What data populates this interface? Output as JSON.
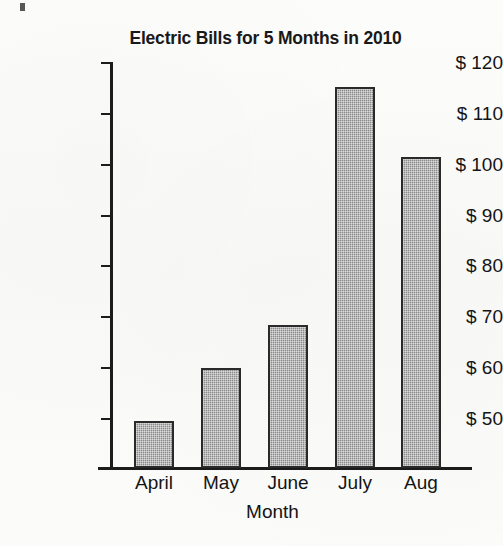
{
  "chart_data": {
    "type": "bar",
    "title": "Electric Bills for 5 Months in 2010",
    "xlabel": "Month",
    "ylabel": "",
    "categories": [
      "April",
      "May",
      "June",
      "July",
      "Aug"
    ],
    "values": [
      49.7,
      60.0,
      68.5,
      115.3,
      101.5
    ],
    "ylim": [
      45,
      120
    ],
    "y_ticks": [
      50,
      60,
      70,
      80,
      90,
      100,
      110,
      120
    ],
    "y_tick_labels": [
      "$ 50",
      "$ 60",
      "$ 70",
      "$ 80",
      "$ 90",
      "$ 100",
      "$ 110",
      "$ 120"
    ],
    "grid": false,
    "legend": "none",
    "bar_color": "#8a8a8a",
    "bar_border_color": "#2a2a2a",
    "axis_color": "#1c1c1c",
    "background_color": "#fbfbfa"
  }
}
